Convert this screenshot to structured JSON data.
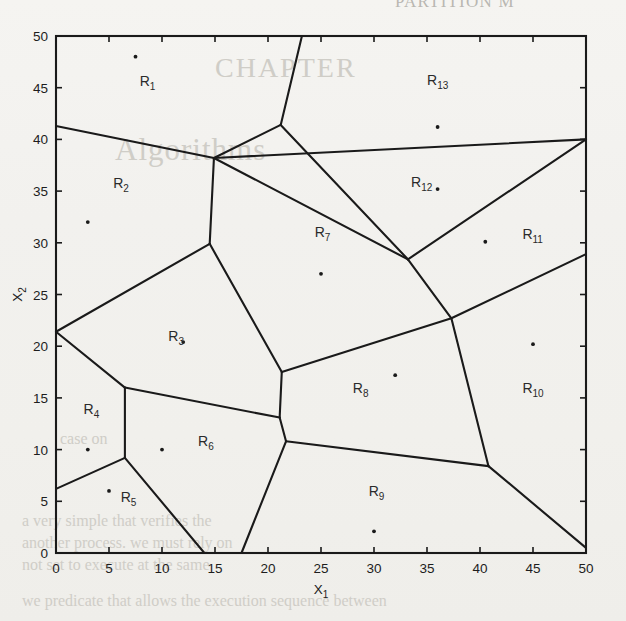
{
  "page": {
    "running_header": "PARTITION M",
    "bleed_through_lines": [
      "CHAPTER",
      "Algorithms",
      "case on",
      "a very simple that verifies the",
      "another process. we must rely on",
      "not set to execute at the same",
      "we predicate that allows the execution sequence between"
    ]
  },
  "chart_data": {
    "type": "scatter",
    "title": "",
    "subtitle": "",
    "xlabel": "X_1",
    "xlabel_display": "X",
    "xlabel_sub": "1",
    "ylabel": "X_2",
    "ylabel_display": "X",
    "ylabel_sub": "2",
    "xlim": [
      0,
      50
    ],
    "ylim": [
      0,
      50
    ],
    "xticks": [
      0,
      5,
      10,
      15,
      20,
      25,
      30,
      35,
      40,
      45,
      50
    ],
    "yticks": [
      0,
      5,
      10,
      15,
      20,
      25,
      30,
      35,
      40,
      45,
      50
    ],
    "grid": false,
    "legend": "none",
    "frame": "box",
    "line_color": "#1a1a1a",
    "point_color": "#1a1a1a",
    "background": "#f3f2ef",
    "regions": [
      {
        "id": "R1",
        "label": "R",
        "sub": "1",
        "label_x": 7.9,
        "label_y": 45.2
      },
      {
        "id": "R2",
        "label": "R",
        "sub": "2",
        "label_x": 5.4,
        "label_y": 35.3
      },
      {
        "id": "R3",
        "label": "R",
        "sub": "3",
        "label_x": 10.6,
        "label_y": 20.5
      },
      {
        "id": "R4",
        "label": "R",
        "sub": "4",
        "label_x": 2.6,
        "label_y": 13.4
      },
      {
        "id": "R5",
        "label": "R",
        "sub": "5",
        "label_x": 6.1,
        "label_y": 4.9
      },
      {
        "id": "R6",
        "label": "R",
        "sub": "6",
        "label_x": 13.4,
        "label_y": 10.3
      },
      {
        "id": "R7",
        "label": "R",
        "sub": "7",
        "label_x": 24.4,
        "label_y": 30.6
      },
      {
        "id": "R8",
        "label": "R",
        "sub": "8",
        "label_x": 28.0,
        "label_y": 15.5
      },
      {
        "id": "R9",
        "label": "R",
        "sub": "9",
        "label_x": 29.5,
        "label_y": 5.5
      },
      {
        "id": "R10",
        "label": "R",
        "sub": "10",
        "label_x": 44.0,
        "label_y": 15.5
      },
      {
        "id": "R11",
        "label": "R",
        "sub": "11",
        "label_x": 44.0,
        "label_y": 30.4
      },
      {
        "id": "R12",
        "label": "R",
        "sub": "12",
        "label_x": 33.5,
        "label_y": 35.4
      },
      {
        "id": "R13",
        "label": "R",
        "sub": "13",
        "label_x": 35.0,
        "label_y": 45.3
      }
    ],
    "points": [
      {
        "region": "R1",
        "x": 7.5,
        "y": 48.0
      },
      {
        "region": "R2",
        "x": 3.0,
        "y": 32.0
      },
      {
        "region": "R3",
        "x": 12.0,
        "y": 20.4
      },
      {
        "region": "R4",
        "x": 3.0,
        "y": 10.0
      },
      {
        "region": "R5",
        "x": 5.0,
        "y": 6.0
      },
      {
        "region": "R6",
        "x": 10.0,
        "y": 10.0
      },
      {
        "region": "R7",
        "x": 25.0,
        "y": 27.0
      },
      {
        "region": "R8",
        "x": 32.0,
        "y": 17.2
      },
      {
        "region": "R9",
        "x": 30.0,
        "y": 2.1
      },
      {
        "region": "R10",
        "x": 45.0,
        "y": 20.2
      },
      {
        "region": "R11",
        "x": 40.5,
        "y": 30.1
      },
      {
        "region": "R12",
        "x": 36.0,
        "y": 35.2
      },
      {
        "region": "R13",
        "x": 36.0,
        "y": 41.2
      }
    ],
    "edges": [
      {
        "from": [
          0.0,
          41.3
        ],
        "to": [
          14.9,
          38.2
        ]
      },
      {
        "from": [
          14.9,
          38.2
        ],
        "to": [
          21.2,
          41.4
        ]
      },
      {
        "from": [
          21.2,
          41.4
        ],
        "to": [
          23.2,
          50.0
        ]
      },
      {
        "from": [
          21.2,
          41.4
        ],
        "to": [
          33.2,
          28.4
        ]
      },
      {
        "from": [
          14.9,
          38.2
        ],
        "to": [
          14.5,
          29.9
        ]
      },
      {
        "from": [
          14.5,
          29.9
        ],
        "to": [
          0.0,
          21.4
        ]
      },
      {
        "from": [
          14.5,
          29.9
        ],
        "to": [
          21.3,
          17.5
        ]
      },
      {
        "from": [
          0.0,
          21.4
        ],
        "to": [
          6.5,
          16.0
        ]
      },
      {
        "from": [
          6.5,
          16.0
        ],
        "to": [
          6.5,
          9.2
        ]
      },
      {
        "from": [
          6.5,
          16.0
        ],
        "to": [
          21.1,
          13.1
        ]
      },
      {
        "from": [
          6.5,
          9.2
        ],
        "to": [
          0.0,
          6.2
        ]
      },
      {
        "from": [
          6.5,
          9.2
        ],
        "to": [
          14.0,
          0.0
        ]
      },
      {
        "from": [
          21.3,
          17.5
        ],
        "to": [
          21.1,
          13.1
        ]
      },
      {
        "from": [
          21.1,
          13.1
        ],
        "to": [
          21.7,
          10.8
        ]
      },
      {
        "from": [
          21.7,
          10.8
        ],
        "to": [
          17.5,
          0.0
        ]
      },
      {
        "from": [
          21.7,
          10.8
        ],
        "to": [
          40.8,
          8.4
        ]
      },
      {
        "from": [
          21.3,
          17.5
        ],
        "to": [
          37.3,
          22.7
        ]
      },
      {
        "from": [
          37.3,
          22.7
        ],
        "to": [
          33.2,
          28.4
        ]
      },
      {
        "from": [
          33.2,
          28.4
        ],
        "to": [
          50.0,
          40.0
        ]
      },
      {
        "from": [
          33.2,
          28.4
        ],
        "to": [
          14.9,
          38.2
        ]
      },
      {
        "from": [
          37.3,
          22.7
        ],
        "to": [
          40.8,
          8.4
        ]
      },
      {
        "from": [
          40.8,
          8.4
        ],
        "to": [
          50.0,
          0.5
        ]
      },
      {
        "from": [
          37.3,
          22.7
        ],
        "to": [
          50.0,
          28.9
        ]
      },
      {
        "from": [
          50.0,
          40.0
        ],
        "to": [
          14.9,
          38.2
        ]
      }
    ]
  }
}
